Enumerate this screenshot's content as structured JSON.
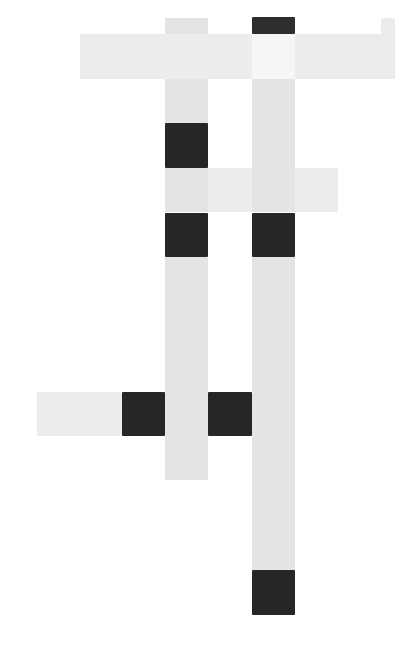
{
  "puzzle": {
    "type": "crossword-grid",
    "colors": {
      "light": "#e4e4e4",
      "pale": "#ececec",
      "white": "#f6f6f6",
      "black": "#262626"
    },
    "cells": [
      {
        "x": 165,
        "y": 18,
        "w": 43,
        "h": 16,
        "kind": "light"
      },
      {
        "x": 252,
        "y": 17,
        "w": 43,
        "h": 17,
        "kind": "dark"
      },
      {
        "x": 381,
        "y": 18,
        "w": 14,
        "h": 16,
        "kind": "pale"
      },
      {
        "x": 80,
        "y": 34,
        "w": 42,
        "h": 45,
        "kind": "pale"
      },
      {
        "x": 122,
        "y": 34,
        "w": 43,
        "h": 45,
        "kind": "pale"
      },
      {
        "x": 165,
        "y": 34,
        "w": 43,
        "h": 45,
        "kind": "pale"
      },
      {
        "x": 208,
        "y": 34,
        "w": 44,
        "h": 45,
        "kind": "pale"
      },
      {
        "x": 252,
        "y": 34,
        "w": 43,
        "h": 45,
        "kind": "white"
      },
      {
        "x": 295,
        "y": 34,
        "w": 43,
        "h": 45,
        "kind": "pale"
      },
      {
        "x": 338,
        "y": 34,
        "w": 43,
        "h": 45,
        "kind": "pale"
      },
      {
        "x": 381,
        "y": 34,
        "w": 14,
        "h": 45,
        "kind": "pale"
      },
      {
        "x": 165,
        "y": 79,
        "w": 43,
        "h": 44,
        "kind": "light"
      },
      {
        "x": 252,
        "y": 79,
        "w": 43,
        "h": 44,
        "kind": "light"
      },
      {
        "x": 165,
        "y": 123,
        "w": 43,
        "h": 45,
        "kind": "black"
      },
      {
        "x": 252,
        "y": 123,
        "w": 43,
        "h": 45,
        "kind": "light"
      },
      {
        "x": 165,
        "y": 168,
        "w": 43,
        "h": 44,
        "kind": "light"
      },
      {
        "x": 208,
        "y": 168,
        "w": 44,
        "h": 44,
        "kind": "pale"
      },
      {
        "x": 252,
        "y": 168,
        "w": 43,
        "h": 44,
        "kind": "light"
      },
      {
        "x": 295,
        "y": 168,
        "w": 43,
        "h": 44,
        "kind": "pale"
      },
      {
        "x": 165,
        "y": 213,
        "w": 43,
        "h": 44,
        "kind": "black"
      },
      {
        "x": 252,
        "y": 213,
        "w": 43,
        "h": 44,
        "kind": "black"
      },
      {
        "x": 165,
        "y": 257,
        "w": 43,
        "h": 44,
        "kind": "light"
      },
      {
        "x": 252,
        "y": 257,
        "w": 43,
        "h": 44,
        "kind": "light"
      },
      {
        "x": 165,
        "y": 301,
        "w": 43,
        "h": 45,
        "kind": "light"
      },
      {
        "x": 252,
        "y": 301,
        "w": 43,
        "h": 45,
        "kind": "light"
      },
      {
        "x": 165,
        "y": 346,
        "w": 43,
        "h": 46,
        "kind": "light"
      },
      {
        "x": 252,
        "y": 346,
        "w": 43,
        "h": 46,
        "kind": "light"
      },
      {
        "x": 37,
        "y": 392,
        "w": 43,
        "h": 44,
        "kind": "pale"
      },
      {
        "x": 80,
        "y": 392,
        "w": 42,
        "h": 44,
        "kind": "pale"
      },
      {
        "x": 122,
        "y": 392,
        "w": 43,
        "h": 44,
        "kind": "black"
      },
      {
        "x": 165,
        "y": 392,
        "w": 43,
        "h": 44,
        "kind": "light"
      },
      {
        "x": 208,
        "y": 392,
        "w": 44,
        "h": 44,
        "kind": "black"
      },
      {
        "x": 252,
        "y": 392,
        "w": 43,
        "h": 44,
        "kind": "light"
      },
      {
        "x": 165,
        "y": 436,
        "w": 43,
        "h": 44,
        "kind": "light"
      },
      {
        "x": 252,
        "y": 436,
        "w": 43,
        "h": 44,
        "kind": "light"
      },
      {
        "x": 252,
        "y": 480,
        "w": 43,
        "h": 45,
        "kind": "light"
      },
      {
        "x": 252,
        "y": 525,
        "w": 43,
        "h": 45,
        "kind": "light"
      },
      {
        "x": 252,
        "y": 570,
        "w": 43,
        "h": 45,
        "kind": "black"
      }
    ]
  }
}
